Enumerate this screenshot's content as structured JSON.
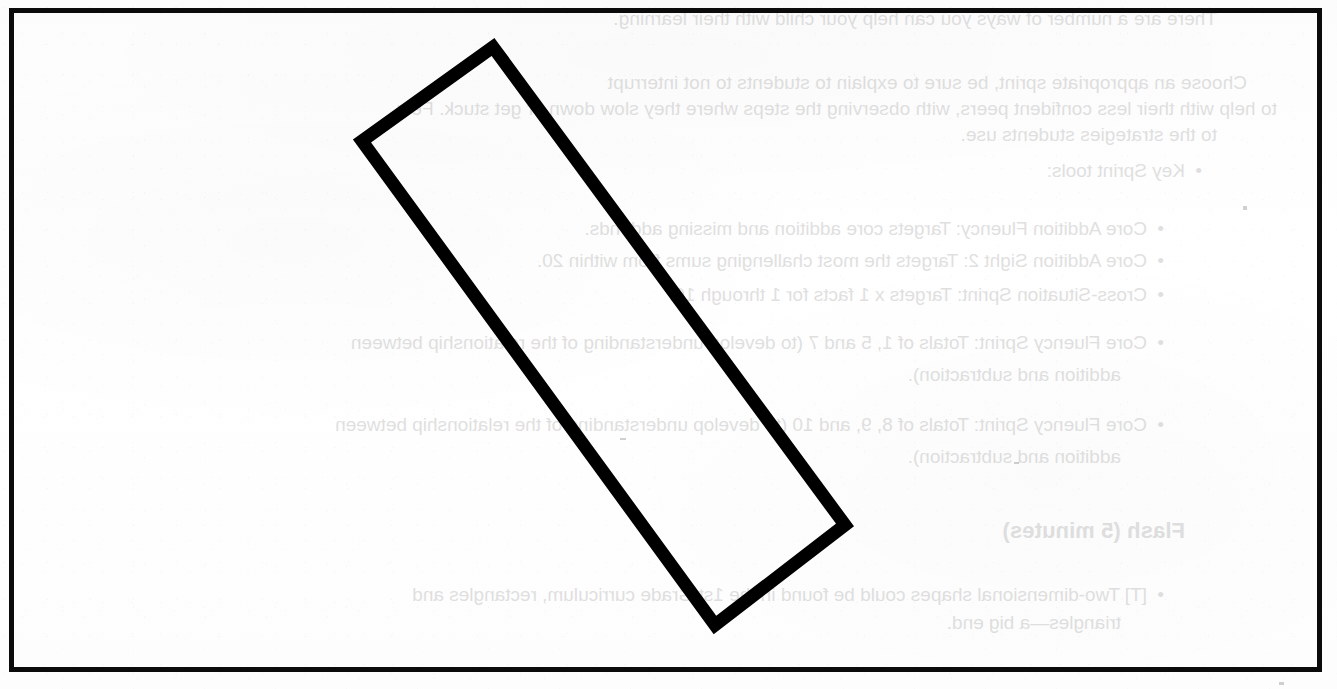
{
  "page": {
    "width": 1337,
    "height": 689,
    "background_color": "#fdfdfd",
    "frame_color": "#0b0b0b",
    "frame_thickness_px": 5,
    "type": "scanned-worksheet-page"
  },
  "shape": {
    "name": "rotated-rectangle",
    "description": "hand-drawn thick-stroked rectangle rotated roughly 36 degrees clockwise",
    "stroke_color": "#000000",
    "stroke_width_px": 13,
    "fill": "none",
    "corners": {
      "top": {
        "x": 493,
        "y": 47
      },
      "left": {
        "x": 362,
        "y": 141
      },
      "right": {
        "x": 845,
        "y": 525
      },
      "bottom": {
        "x": 715,
        "y": 625
      }
    },
    "rotation_degrees": 36
  },
  "bleed_through": {
    "note": "Faint mirrored text showing through from the reverse side of the paper",
    "mirrored": true,
    "color": "#9a9a9a",
    "opacity": 0.3,
    "lines": [
      {
        "id": "l0",
        "text": "There are a number of ways you can help your child with their learning.",
        "x": 120,
        "y": 6,
        "style": "line"
      },
      {
        "id": "l1",
        "text": "Choose an appropriate sprint, be sure to explain to students to not interrupt",
        "x": 90,
        "y": 70,
        "style": "line"
      },
      {
        "id": "l2",
        "text": "to help with their less confident peers, with observing the steps where they slow down or get stuck. Few",
        "x": 60,
        "y": 96,
        "style": "line"
      },
      {
        "id": "l3",
        "text": "to the strategies students use.",
        "x": 120,
        "y": 122,
        "style": "line"
      },
      {
        "id": "l4",
        "text": "Key Sprint tools:",
        "x": 152,
        "y": 158,
        "style": "bullet"
      },
      {
        "id": "l5",
        "text": "Core Addition Fluency: Targets core addition and missing addends.",
        "x": 190,
        "y": 216,
        "style": "bullet"
      },
      {
        "id": "l6",
        "text": "Core Addition Sight 2: Targets the most challenging sums from within 20.",
        "x": 190,
        "y": 248,
        "style": "bullet"
      },
      {
        "id": "l7",
        "text": "Cross-Situation Sprint: Targets x 1 facts for 1 through 10.",
        "x": 190,
        "y": 282,
        "style": "bullet"
      },
      {
        "id": "l8",
        "text": "Core Fluency Sprint: Totals of 1, 5 and 7 (to develop understanding of the relationship between",
        "x": 190,
        "y": 330,
        "style": "bullet"
      },
      {
        "id": "l9",
        "text": "addition and subtraction).",
        "x": 216,
        "y": 364,
        "style": "indent"
      },
      {
        "id": "l10",
        "text": "Core Fluency Sprint: Totals of 8, 9, and 10 (to develop understanding of the relationship between",
        "x": 190,
        "y": 412,
        "style": "bullet"
      },
      {
        "id": "l11",
        "text": "addition and subtraction).",
        "x": 216,
        "y": 446,
        "style": "indent"
      },
      {
        "id": "l12",
        "text": "Flash (5 minutes)",
        "x": 152,
        "y": 516,
        "style": "head"
      },
      {
        "id": "l13",
        "text": "[T] Two-dimensional shapes could be found in the 1st Grade curriculum, rectangles and",
        "x": 190,
        "y": 582,
        "style": "bullet"
      },
      {
        "id": "l14",
        "text": "triangles—a big end.",
        "x": 216,
        "y": 612,
        "style": "indent"
      }
    ]
  },
  "stray_marks": [
    {
      "x": 1243,
      "y": 206,
      "w": 4,
      "h": 4
    },
    {
      "x": 1279,
      "y": 682,
      "w": 5,
      "h": 3
    },
    {
      "x": 620,
      "y": 438,
      "w": 6,
      "h": 2
    },
    {
      "x": 1014,
      "y": 462,
      "w": 5,
      "h": 2
    }
  ]
}
